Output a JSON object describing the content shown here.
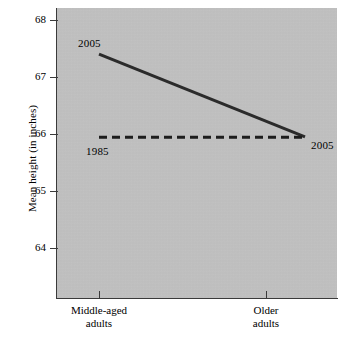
{
  "chart_data": {
    "type": "line",
    "title": "",
    "subtitle": "",
    "xlabel": "",
    "ylabel": "Mean height (in inches)",
    "categories": [
      "Middle-aged\nadults",
      "Older\nadults"
    ],
    "x_tick_labels": [
      "Middle-aged\nadults",
      "Older\nadults"
    ],
    "y_tick_labels": [
      "68",
      "67",
      "66",
      "65",
      "64"
    ],
    "y_ticks": [
      68,
      67,
      66,
      65,
      64
    ],
    "ylim": [
      63.55,
      68.15
    ],
    "xlim": [
      0,
      1
    ],
    "grid": false,
    "legend": "none",
    "plot_background": "#c2c2c2",
    "axis_color": "#3a3a3a",
    "series": [
      {
        "name": "2005",
        "style": "solid",
        "color": "#2b2b2b",
        "width": 3,
        "values": [
          67.4,
          65.95
        ],
        "x": [
          0,
          1
        ]
      },
      {
        "name": "1985",
        "style": "dashed",
        "color": "#1d1d1d",
        "width": 3,
        "values": [
          65.95,
          65.95
        ],
        "x": [
          0,
          1
        ]
      }
    ],
    "annotations": [
      {
        "text": "2005",
        "series": "2005",
        "anchor": "start-above-left"
      },
      {
        "text": "1985",
        "series": "1985",
        "anchor": "start-below-right"
      },
      {
        "text": "2005",
        "series": "1985",
        "anchor": "end-right"
      }
    ]
  },
  "axis": {
    "y_title": "Mean height (in inches)"
  },
  "labels": {
    "solid_start": "2005",
    "dashed_start": "1985",
    "dashed_end": "2005"
  },
  "y_ticks": [
    {
      "label": "68"
    },
    {
      "label": "67"
    },
    {
      "label": "66"
    },
    {
      "label": "65"
    },
    {
      "label": "64"
    }
  ],
  "x_ticks": [
    {
      "label": "Middle-aged\nadults"
    },
    {
      "label": "Older\nadults"
    }
  ]
}
